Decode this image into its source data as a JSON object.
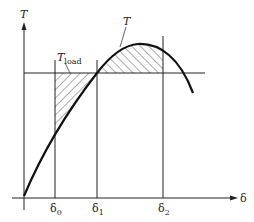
{
  "diagram": {
    "type": "torque-angle curve (equal-area criterion)",
    "axes": {
      "y_label": "T",
      "x_label": "δ"
    },
    "curves": [
      {
        "name": "T",
        "label": "T",
        "description": "torque curve, rising from origin to a peak then falling"
      },
      {
        "name": "T_load",
        "label_main": "T",
        "label_sub": "load",
        "description": "horizontal load torque line"
      }
    ],
    "x_markers": [
      {
        "label_main": "δ",
        "label_sub": "0"
      },
      {
        "label_main": "δ",
        "label_sub": "1"
      },
      {
        "label_main": "δ",
        "label_sub": "2"
      }
    ],
    "shaded_regions": [
      {
        "name": "accelerating-area",
        "between": "δ0-δ1",
        "position": "below T_load, above T"
      },
      {
        "name": "decelerating-area",
        "between": "δ1-δ2",
        "position": "above T_load, below T"
      }
    ],
    "colors": {
      "line": "#222222",
      "background": "#ffffff"
    }
  }
}
